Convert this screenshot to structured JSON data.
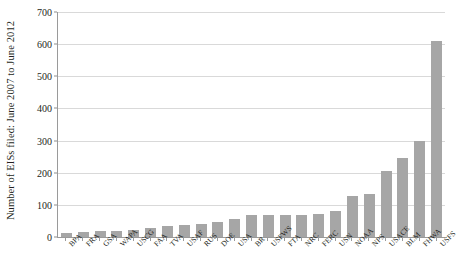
{
  "chart_data": {
    "type": "bar",
    "title": "",
    "xlabel": "",
    "ylabel": "Number of EISs filed: June 2007 to June 2012",
    "ylim": [
      0,
      700
    ],
    "ytick_step": 100,
    "yticks": [
      "0",
      "100",
      "200",
      "300",
      "400",
      "500",
      "600",
      "700"
    ],
    "grid": true,
    "legend": "none",
    "bar_color": "#a6a6a6",
    "categories": [
      "BPA",
      "FRA",
      "GSA",
      "WAPA",
      "USCG",
      "FAA",
      "TVA",
      "USAF",
      "RUS",
      "DOE",
      "USA",
      "BR",
      "USFWS",
      "FTA",
      "NRC",
      "FERC",
      "USN",
      "NOAA",
      "NPS",
      "USACE",
      "BLM",
      "FHWA",
      "USFS"
    ],
    "values": [
      12,
      16,
      18,
      19,
      22,
      27,
      33,
      36,
      42,
      48,
      55,
      70,
      70,
      70,
      70,
      72,
      80,
      128,
      135,
      205,
      245,
      300,
      610
    ]
  }
}
